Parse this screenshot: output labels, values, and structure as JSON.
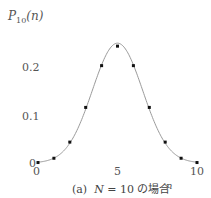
{
  "chart_data": {
    "type": "line",
    "title": "",
    "caption": "(a)  N = 10 の場合",
    "caption_parts": {
      "prefix": "(a)",
      "var": "N",
      "rest": " = 10 の場合"
    },
    "xlabel": "n",
    "ylabel": "P10(n)",
    "ylabel_parts": {
      "main": "P",
      "sub": "10",
      "arg": "(n)"
    },
    "x": [
      0,
      1,
      2,
      3,
      4,
      5,
      6,
      7,
      8,
      9,
      10
    ],
    "values": [
      0.001,
      0.01,
      0.044,
      0.117,
      0.205,
      0.246,
      0.205,
      0.117,
      0.044,
      0.01,
      0.001
    ],
    "xticks": [
      "0",
      "5",
      "10"
    ],
    "yticks": [
      "0",
      "0.1",
      "0.2"
    ],
    "xlim": [
      0,
      10
    ],
    "ylim": [
      0,
      0.25
    ],
    "grid": false,
    "markers": "dots",
    "curve": "smooth gaussian fit",
    "colors": {
      "curve": "#9a9a9a",
      "marker": "#111111"
    }
  }
}
